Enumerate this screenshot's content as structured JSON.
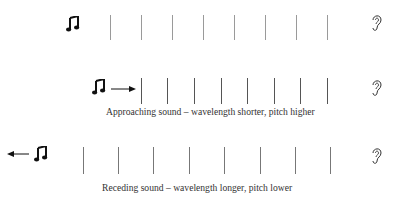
{
  "diagram": {
    "rows": [
      {
        "name": "stationary",
        "source_icon": "music-note-icon",
        "listener_icon": "ear-icon",
        "motion": "none",
        "caption": ""
      },
      {
        "name": "approaching",
        "source_icon": "music-note-icon",
        "listener_icon": "ear-icon",
        "motion": "arrow-right-icon",
        "caption": "Approaching sound – wavelength shorter, pitch higher"
      },
      {
        "name": "receding",
        "source_icon": "music-note-icon",
        "listener_icon": "ear-icon",
        "motion": "arrow-left-icon",
        "caption": "Receding sound – wavelength longer, pitch lower"
      }
    ],
    "colors": {
      "wavefront_stationary": "#9a9a9a",
      "wavefront_approaching": "#555555",
      "wavefront_receding": "#777777",
      "icon": "#111111"
    }
  }
}
